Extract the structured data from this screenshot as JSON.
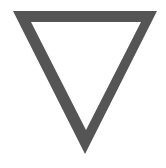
{
  "graphic": {
    "shape": "inverted-triangle-outline",
    "icon": "triangle-down-icon",
    "stroke_color": "#555555",
    "background_color": "#ffffff",
    "outer_points": [
      [
        13,
        11
      ],
      [
        157,
        11
      ],
      [
        85,
        154
      ]
    ],
    "inner_points": [
      [
        31,
        22
      ],
      [
        141,
        22
      ],
      [
        86,
        130
      ]
    ]
  }
}
